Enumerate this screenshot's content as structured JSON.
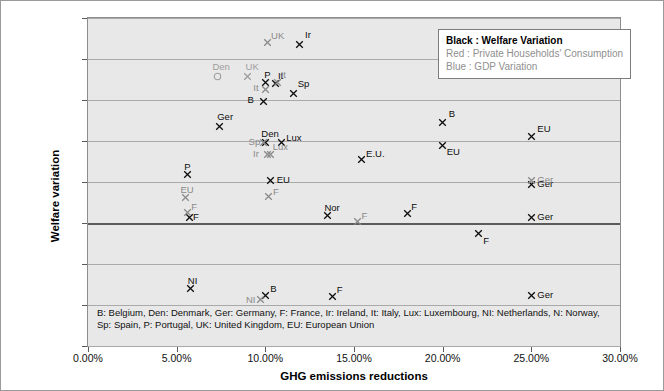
{
  "chart_data": {
    "type": "scatter",
    "title": "",
    "xlabel": "GHG emissions reductions",
    "ylabel": "Welfare variation",
    "xlim": [
      0,
      30
    ],
    "ylim": [
      -1.5,
      2.5
    ],
    "xticks": [
      "0.00%",
      "5.00%",
      "10.00%",
      "15.00%",
      "20.00%",
      "25.00%",
      "30.00%"
    ],
    "xtick_values": [
      0,
      5,
      10,
      15,
      20,
      25,
      30
    ],
    "yticks": [
      "2.50%",
      "2.00%",
      "1.50%",
      "1.00%",
      "0.50%",
      "0.00%",
      "-0.50%",
      "-1.00%",
      "-1.50%"
    ],
    "ytick_values": [
      2.5,
      2.0,
      1.5,
      1.0,
      0.5,
      0.0,
      -0.5,
      -1.0,
      -1.5
    ],
    "grid": "horizontal",
    "legend_position": "top-right",
    "series": [
      {
        "name": "Welfare Variation",
        "color": "#0d0d0d",
        "marker": "x",
        "points": [
          {
            "label": "Ir",
            "x": 11.9,
            "y": 2.18,
            "lx": 6,
            "ly": -14
          },
          {
            "label": "Sp",
            "x": 11.6,
            "y": 1.58,
            "lx": 4,
            "ly": -14
          },
          {
            "label": "It",
            "x": 10.6,
            "y": 1.7,
            "lx": 2,
            "ly": -13
          },
          {
            "label": "P",
            "x": 10.0,
            "y": 1.71,
            "lx": -1,
            "ly": -13
          },
          {
            "label": "B",
            "x": 9.9,
            "y": 1.48,
            "lx": -16,
            "ly": -7
          },
          {
            "label": "Ger",
            "x": 7.4,
            "y": 1.18,
            "lx": -2,
            "ly": -14
          },
          {
            "label": "B",
            "x": 20.0,
            "y": 1.23,
            "lx": 6,
            "ly": -13
          },
          {
            "label": "EU",
            "x": 25.0,
            "y": 1.06,
            "lx": 6,
            "ly": -12
          },
          {
            "label": "Den",
            "x": 10.0,
            "y": 0.98,
            "lx": -4,
            "ly": -14
          },
          {
            "label": "Lux",
            "x": 10.9,
            "y": 0.98,
            "lx": 5,
            "ly": -10
          },
          {
            "label": "E.U.",
            "x": 15.4,
            "y": 0.78,
            "lx": 5,
            "ly": -10
          },
          {
            "label": "EU",
            "x": 20.0,
            "y": 0.95,
            "lx": 4,
            "ly": 2
          },
          {
            "label": "EU",
            "x": 10.3,
            "y": 0.52,
            "lx": 6,
            "ly": -5
          },
          {
            "label": "P",
            "x": 5.6,
            "y": 0.59,
            "lx": -3,
            "ly": -13
          },
          {
            "label": "Nor",
            "x": 13.5,
            "y": 0.09,
            "lx": -3,
            "ly": -13
          },
          {
            "label": "F",
            "x": 18.0,
            "y": 0.11,
            "lx": 4,
            "ly": -12
          },
          {
            "label": "Ger",
            "x": 25.0,
            "y": 0.47,
            "lx": 6,
            "ly": -5
          },
          {
            "label": "Ger",
            "x": 25.0,
            "y": 0.07,
            "lx": 6,
            "ly": -5
          },
          {
            "label": "F",
            "x": 22.0,
            "y": -0.13,
            "lx": 5,
            "ly": 2
          },
          {
            "label": "NI",
            "x": 5.8,
            "y": -0.8,
            "lx": -3,
            "ly": -13
          },
          {
            "label": "B",
            "x": 10.0,
            "y": -0.89,
            "lx": 5,
            "ly": -12
          },
          {
            "label": "F",
            "x": 13.8,
            "y": -0.9,
            "lx": 4,
            "ly": -12
          },
          {
            "label": "Ger",
            "x": 25.0,
            "y": -0.88,
            "lx": 6,
            "ly": -5
          },
          {
            "label": "F",
            "x": 5.7,
            "y": 0.07,
            "lx": 4,
            "ly": -5
          }
        ]
      },
      {
        "name": "Private Households' Consumption",
        "color": "#8a8a8a",
        "marker": "x",
        "points": [
          {
            "label": "UK",
            "x": 10.1,
            "y": 2.2,
            "lx": 4,
            "ly": -12
          },
          {
            "label": "It",
            "x": 10.0,
            "y": 1.63,
            "lx": -12,
            "ly": -6
          },
          {
            "label": "It",
            "x": 10.7,
            "y": 1.71,
            "lx": 3,
            "ly": -13
          },
          {
            "label": "Sp",
            "x": 9.9,
            "y": 0.98,
            "lx": -15,
            "ly": -6
          },
          {
            "label": "Ir",
            "x": 10.1,
            "y": 0.83,
            "lx": -14,
            "ly": -6
          },
          {
            "label": "Lux",
            "x": 10.3,
            "y": 0.84,
            "lx": 2,
            "ly": -12
          },
          {
            "label": "EU",
            "x": 5.5,
            "y": 0.31,
            "lx": -5,
            "ly": -13
          },
          {
            "label": "F",
            "x": 5.6,
            "y": 0.13,
            "lx": 4,
            "ly": -10
          },
          {
            "label": "F",
            "x": 10.2,
            "y": 0.32,
            "lx": 4,
            "ly": -10
          },
          {
            "label": "F",
            "x": 15.2,
            "y": 0.02,
            "lx": 4,
            "ly": -10
          },
          {
            "label": "Ger",
            "x": 25.0,
            "y": 0.52,
            "lx": 6,
            "ly": -5
          },
          {
            "label": "NI",
            "x": 9.7,
            "y": -0.93,
            "lx": -14,
            "ly": -4
          }
        ]
      },
      {
        "name": "GDP Variation",
        "color": "#9d9d9d",
        "marker": "x",
        "points": [
          {
            "label": "Den",
            "x": 7.3,
            "y": 1.79,
            "lx": -5,
            "ly": -14,
            "marker": "o"
          },
          {
            "label": "UK",
            "x": 9.0,
            "y": 1.79,
            "lx": -2,
            "ly": -14
          }
        ]
      }
    ],
    "legend": [
      {
        "text": "Black : Welfare Variation",
        "weight": "bold"
      },
      {
        "text": "Red : Private Households' Consumption",
        "weight": "normal"
      },
      {
        "text": "Blue : GDP Variation",
        "weight": "normal"
      }
    ],
    "footnote_lines": [
      "B: Belgium, Den: Denmark, Ger: Germany, F: France, Ir: Ireland, It: Italy, Lux: Luxembourg, NI: Netherlands, N: Norway,",
      "Sp: Spain, P: Portugal, UK: United Kingdom, EU: European Union"
    ]
  }
}
